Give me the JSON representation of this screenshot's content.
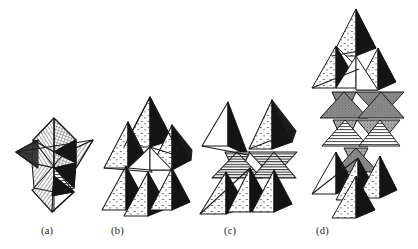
{
  "figure": {
    "name": "fractal-tetrahedron-stages",
    "background_color": "#ffffff",
    "ink_color": "#1a1a1a",
    "media": "pen-and-ink line drawing",
    "width": 418,
    "height": 249,
    "panels": [
      {
        "id": "a",
        "label": "(a)",
        "label_x": 41,
        "label_y": 225,
        "description": "stellated octahedron / compound of two tetrahedra",
        "iteration": 0,
        "bounds": {
          "x": 12,
          "y": 115,
          "w": 85,
          "h": 100
        },
        "center_x": 52,
        "center_y": 165,
        "scale": 1.0,
        "shading": [
          "line-hatch",
          "cross-hatch",
          "solid-black"
        ]
      },
      {
        "id": "b",
        "label": "(b)",
        "label_x": 111,
        "label_y": 225,
        "description": "first-iteration tetrahedral cluster",
        "iteration": 1,
        "bounds": {
          "x": 100,
          "y": 96,
          "w": 92,
          "h": 120
        },
        "center_x": 146,
        "center_y": 155,
        "scale": 1.0,
        "shading": [
          "stipple",
          "white",
          "solid-black"
        ]
      },
      {
        "id": "c",
        "label": "(c)",
        "label_x": 224,
        "label_y": 225,
        "description": "first-iteration cluster, alternate orientation",
        "iteration": 1,
        "bounds": {
          "x": 198,
          "y": 94,
          "w": 105,
          "h": 122
        },
        "center_x": 249,
        "center_y": 155,
        "scale": 1.0,
        "shading": [
          "stipple",
          "horizontal-hatch",
          "solid-black"
        ]
      },
      {
        "id": "d",
        "label": "(d)",
        "label_x": 316,
        "label_y": 225,
        "description": "second-iteration tall tetrahedral stack",
        "iteration": 2,
        "bounds": {
          "x": 300,
          "y": 8,
          "w": 112,
          "h": 210
        },
        "center_x": 356,
        "center_y": 112,
        "scale": 1.0,
        "shading": [
          "gray-stipple",
          "stipple",
          "white",
          "solid-black"
        ]
      }
    ],
    "palette": {
      "ink": "#1a1a1a",
      "paper": "#ffffff",
      "shadow_face": "#111111",
      "gray_face": "#8a8a8a",
      "light_gray_face": "#b9b9b9",
      "hatch": "#3a3a3a"
    }
  }
}
